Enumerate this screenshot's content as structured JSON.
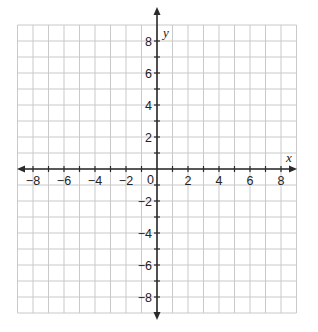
{
  "diagram": {
    "type": "coordinate-plane",
    "x_axis": {
      "label": "x",
      "min": -9,
      "max": 9,
      "tick_labels": [
        "−8",
        "−6",
        "−4",
        "−2",
        "2",
        "4",
        "6",
        "8"
      ],
      "tick_values": [
        -8,
        -6,
        -4,
        -2,
        2,
        4,
        6,
        8
      ]
    },
    "y_axis": {
      "label": "y",
      "min": -9,
      "max": 9,
      "tick_labels": [
        "8",
        "6",
        "4",
        "2",
        "−2",
        "−4",
        "−6",
        "−8"
      ],
      "tick_values": [
        8,
        6,
        4,
        2,
        -2,
        -4,
        -6,
        -8
      ]
    },
    "origin_label": "0",
    "grid": {
      "step": 1,
      "visible": true
    },
    "colors": {
      "grid": "#c9c9c9",
      "axis": "#2a2a2a",
      "text": "#222222"
    }
  }
}
